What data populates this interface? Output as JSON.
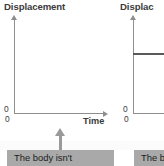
{
  "figure": {
    "background_color": "#ffffff",
    "axis_color": "#8e8e8e",
    "line_color": "#5a5a5a",
    "callout_bg": "#a9a9a9",
    "callout_text_color": "#1c1c1c"
  },
  "charts": [
    {
      "id": "chart-left",
      "title": "Displacement",
      "xlabel": "Time",
      "ylabel": "Displacement",
      "origin_y_label": "0",
      "origin_x_label": "0",
      "caption": "The body isn't"
    },
    {
      "id": "chart-right",
      "title": "Displac",
      "xlabel": "",
      "ylabel": "Displacement",
      "origin_y_label": "0",
      "origin_x_label": "0",
      "caption": "The b"
    }
  ],
  "chart_data": [
    {
      "type": "line",
      "title": "Displacement",
      "xlabel": "Time",
      "ylabel": "Displacement",
      "xlim": [
        0,
        10
      ],
      "ylim": [
        0,
        10
      ],
      "grid": false,
      "legend": null,
      "tick_labels": {
        "x": [
          "0"
        ],
        "y": [
          "0"
        ]
      },
      "series": [
        {
          "name": "displacement",
          "x": [],
          "y": []
        }
      ],
      "annotation": "The body isn't"
    },
    {
      "type": "line",
      "title": "Displacement",
      "xlabel": "",
      "ylabel": "Displacement",
      "xlim": [
        0,
        10
      ],
      "ylim": [
        0,
        10
      ],
      "grid": false,
      "legend": null,
      "tick_labels": {
        "x": [
          "0"
        ],
        "y": [
          "0"
        ]
      },
      "series": [
        {
          "name": "displacement",
          "x": [
            0,
            10
          ],
          "y": [
            6.4,
            6.4
          ]
        }
      ],
      "annotation": "The b"
    }
  ]
}
